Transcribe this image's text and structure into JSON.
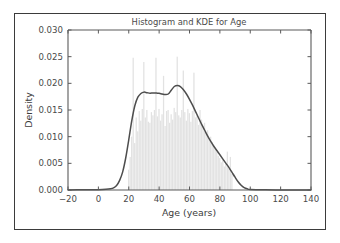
{
  "figure": {
    "title": "Histogram and KDE for Age",
    "background_color": "#ffffff",
    "frame_color": "#3b3b3b"
  },
  "chart_data": {
    "type": "histogram",
    "title": "Histogram and KDE for Age",
    "xlabel": "Age (years)",
    "ylabel": "Density",
    "xlim": [
      -20,
      140
    ],
    "ylim": [
      0.0,
      0.03
    ],
    "grid": false,
    "legend": null,
    "xticks": [
      -20,
      0,
      20,
      40,
      60,
      80,
      100,
      120,
      140
    ],
    "xtick_labels": [
      "−20",
      "0",
      "20",
      "40",
      "60",
      "80",
      "100",
      "120",
      "140"
    ],
    "yticks": [
      0.0,
      0.005,
      0.01,
      0.015,
      0.02,
      0.025,
      0.03
    ],
    "ytick_labels": [
      "0.000",
      "0.005",
      "0.010",
      "0.015",
      "0.020",
      "0.025",
      "0.030"
    ],
    "series": [
      {
        "name": "Histogram",
        "type": "bar",
        "color": "#e2e2e2",
        "bin_width": 1,
        "bin_centers": [
          20,
          21,
          22,
          23,
          24,
          25,
          26,
          27,
          28,
          29,
          30,
          31,
          32,
          33,
          34,
          35,
          36,
          37,
          38,
          39,
          40,
          41,
          42,
          43,
          44,
          45,
          46,
          47,
          48,
          49,
          50,
          51,
          52,
          53,
          54,
          55,
          56,
          57,
          58,
          59,
          60,
          61,
          62,
          63,
          64,
          65,
          66,
          67,
          68,
          69,
          70,
          71,
          72,
          73,
          74,
          75,
          76,
          77,
          78,
          79,
          80,
          81,
          82,
          83,
          84,
          85,
          86,
          87,
          88
        ],
        "values": [
          0.0038,
          0.0062,
          0.01,
          0.0248,
          0.0088,
          0.0136,
          0.011,
          0.0148,
          0.013,
          0.0152,
          0.024,
          0.0136,
          0.015,
          0.0128,
          0.0126,
          0.0146,
          0.014,
          0.015,
          0.0248,
          0.0138,
          0.0152,
          0.013,
          0.0142,
          0.0214,
          0.012,
          0.0148,
          0.015,
          0.0126,
          0.0142,
          0.0132,
          0.0154,
          0.0146,
          0.025,
          0.014,
          0.0136,
          0.015,
          0.0224,
          0.0146,
          0.013,
          0.0152,
          0.0144,
          0.0128,
          0.0148,
          0.022,
          0.0136,
          0.014,
          0.0122,
          0.015,
          0.0132,
          0.012,
          0.0126,
          0.0106,
          0.0112,
          0.0096,
          0.01,
          0.009,
          0.0084,
          0.0078,
          0.0072,
          0.0064,
          0.006,
          0.0052,
          0.0056,
          0.0044,
          0.0048,
          0.0072,
          0.004,
          0.0062,
          0.003
        ]
      },
      {
        "name": "KDE",
        "type": "line",
        "color": "#4d4d4d",
        "x": [
          -20,
          -10,
          0,
          5,
          8,
          10,
          12,
          14,
          16,
          18,
          20,
          22,
          24,
          26,
          28,
          30,
          32,
          34,
          36,
          38,
          40,
          42,
          44,
          46,
          48,
          50,
          52,
          54,
          56,
          58,
          60,
          62,
          64,
          66,
          68,
          70,
          72,
          74,
          76,
          78,
          80,
          82,
          84,
          86,
          88,
          90,
          92,
          94,
          96,
          98,
          100,
          110,
          120,
          130,
          140
        ],
        "y": [
          2e-05,
          3e-05,
          6e-05,
          0.00012,
          0.00022,
          0.0004,
          0.00085,
          0.0018,
          0.0034,
          0.006,
          0.0094,
          0.013,
          0.0158,
          0.0174,
          0.0181,
          0.01835,
          0.01825,
          0.01815,
          0.0182,
          0.01818,
          0.01812,
          0.018,
          0.0179,
          0.018,
          0.0187,
          0.0194,
          0.01958,
          0.0194,
          0.0188,
          0.018,
          0.017,
          0.0159,
          0.0147,
          0.0135,
          0.0123,
          0.0112,
          0.0101,
          0.0091,
          0.0082,
          0.0074,
          0.0066,
          0.0058,
          0.005,
          0.0042,
          0.0033,
          0.0024,
          0.00155,
          0.0009,
          0.00045,
          0.00022,
          0.0001,
          3e-05,
          2e-05,
          1e-05,
          1e-05
        ]
      }
    ]
  }
}
